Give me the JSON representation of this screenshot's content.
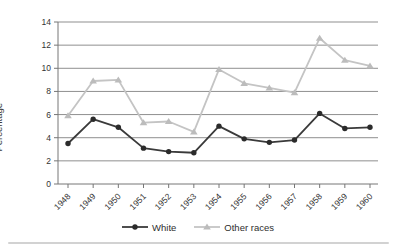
{
  "chart_data": {
    "type": "line",
    "title": "",
    "xlabel": "",
    "ylabel": "Percentage",
    "ylim": [
      0,
      14
    ],
    "ytick_step": 2,
    "grid": "horizontal",
    "legend_position": "bottom",
    "categories": [
      "1948",
      "1949",
      "1950",
      "1951",
      "1952",
      "1953",
      "1954",
      "1955",
      "1956",
      "1957",
      "1958",
      "1959",
      "1960"
    ],
    "series": [
      {
        "name": "White",
        "marker": "circle",
        "color": "#3a3a3a",
        "marker_color": "#2b2b2b",
        "values": [
          3.5,
          5.6,
          4.9,
          3.1,
          2.8,
          2.7,
          5.0,
          3.9,
          3.6,
          3.8,
          6.1,
          4.8,
          4.9
        ]
      },
      {
        "name": "Other races",
        "marker": "triangle",
        "color": "#c4c4c4",
        "marker_color": "#bcbcbc",
        "values": [
          5.9,
          8.9,
          9.0,
          5.3,
          5.4,
          4.5,
          9.9,
          8.7,
          8.3,
          7.9,
          12.6,
          10.7,
          10.2
        ]
      }
    ]
  },
  "colors": {
    "background": "#ffffff",
    "grid": "#8f8f8f",
    "axis": "#767676",
    "tick_text": "#333333",
    "divider": "#d2d2d2"
  }
}
